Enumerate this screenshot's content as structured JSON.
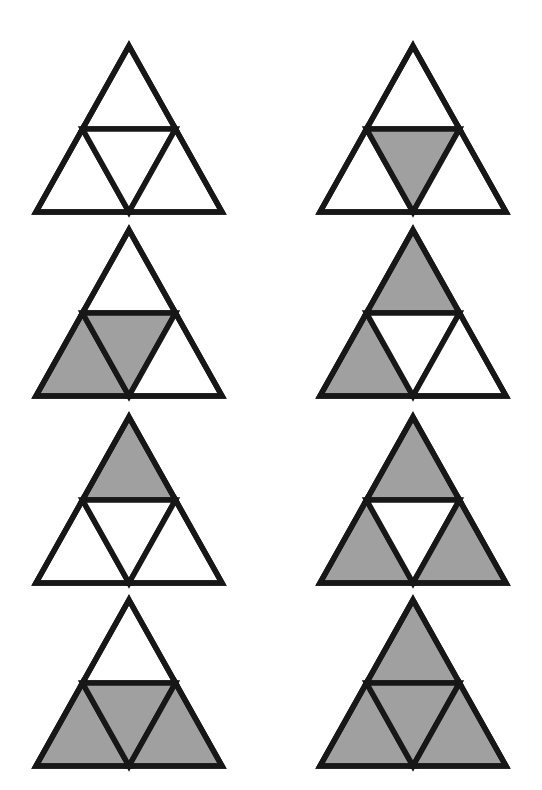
{
  "figure": {
    "background_color": "#ffffff",
    "stroke_color": "#171717",
    "shaded_color": "#a0a0a0",
    "unshaded_color": "#ffffff",
    "stroke_width": 5.5,
    "columns": 2,
    "rows": 4,
    "cell_count": 8,
    "part_names": [
      "top",
      "left",
      "center",
      "right"
    ],
    "part_labels": {
      "top": "top upward sub-triangle",
      "left": "bottom-left upward sub-triangle",
      "center": "center inverted sub-triangle",
      "right": "bottom-right upward sub-triangle"
    }
  },
  "layout": {
    "column_x_left": 36,
    "column_x_right": 320,
    "triangle_width": 186,
    "triangle_height": 166,
    "row_y_tops": [
      46,
      230,
      417,
      600
    ],
    "row_gap": 184
  },
  "cells": [
    {
      "id": "cell-r1c1",
      "row": 1,
      "column": 1,
      "shaded_count": 0,
      "shaded_parts": [],
      "parts": {
        "top": false,
        "left": false,
        "center": false,
        "right": false
      }
    },
    {
      "id": "cell-r1c2",
      "row": 1,
      "column": 2,
      "shaded_count": 1,
      "shaded_parts": [
        "center"
      ],
      "parts": {
        "top": false,
        "left": false,
        "center": true,
        "right": false
      }
    },
    {
      "id": "cell-r2c1",
      "row": 2,
      "column": 1,
      "shaded_count": 2,
      "shaded_parts": [
        "left",
        "center"
      ],
      "parts": {
        "top": false,
        "left": true,
        "center": true,
        "right": false
      }
    },
    {
      "id": "cell-r2c2",
      "row": 2,
      "column": 2,
      "shaded_count": 2,
      "shaded_parts": [
        "top",
        "left"
      ],
      "parts": {
        "top": true,
        "left": true,
        "center": false,
        "right": false
      }
    },
    {
      "id": "cell-r3c1",
      "row": 3,
      "column": 1,
      "shaded_count": 1,
      "shaded_parts": [
        "top"
      ],
      "parts": {
        "top": true,
        "left": false,
        "center": false,
        "right": false
      }
    },
    {
      "id": "cell-r3c2",
      "row": 3,
      "column": 2,
      "shaded_count": 3,
      "shaded_parts": [
        "top",
        "left",
        "right"
      ],
      "parts": {
        "top": true,
        "left": true,
        "center": false,
        "right": true
      }
    },
    {
      "id": "cell-r4c1",
      "row": 4,
      "column": 1,
      "shaded_count": 3,
      "shaded_parts": [
        "left",
        "center",
        "right"
      ],
      "parts": {
        "top": false,
        "left": true,
        "center": true,
        "right": true
      }
    },
    {
      "id": "cell-r4c2",
      "row": 4,
      "column": 2,
      "shaded_count": 4,
      "shaded_parts": [
        "top",
        "left",
        "center",
        "right"
      ],
      "parts": {
        "top": true,
        "left": true,
        "center": true,
        "right": true
      }
    }
  ]
}
